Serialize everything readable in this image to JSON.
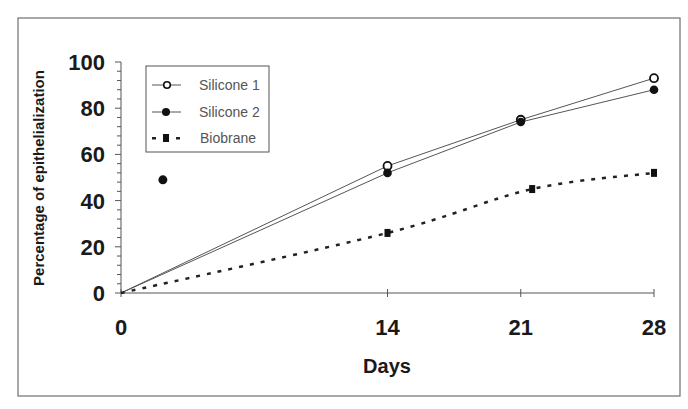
{
  "chart_data": {
    "type": "line",
    "title": "",
    "xlabel": "Days",
    "ylabel": "Percentage of epithelialization",
    "xlim": [
      0,
      28
    ],
    "ylim": [
      0,
      100
    ],
    "x_ticks": [
      0,
      14,
      21,
      28
    ],
    "x_tick_labels": [
      "0",
      "14",
      "21",
      "28"
    ],
    "y_ticks": [
      0,
      20,
      40,
      60,
      80,
      100
    ],
    "y_tick_labels": [
      "0",
      "20",
      "40",
      "60",
      "80",
      "100"
    ],
    "y_minor_step": 4,
    "grid": false,
    "legend_position": "upper-left-inside",
    "series": [
      {
        "name": "Silicone 1",
        "marker": "open-circle",
        "line": "solid",
        "points": [
          [
            0,
            0
          ],
          [
            14,
            55
          ],
          [
            21,
            75
          ],
          [
            28,
            93
          ]
        ]
      },
      {
        "name": "Silicone 2",
        "marker": "filled-circle",
        "line": "solid",
        "points": [
          [
            0,
            0
          ],
          [
            14,
            52
          ],
          [
            21,
            74
          ],
          [
            28,
            88
          ]
        ]
      },
      {
        "name": "Biobrane",
        "marker": "filled-square",
        "line": "dotted",
        "points": [
          [
            0,
            0
          ],
          [
            14,
            26
          ],
          [
            21.6,
            45
          ],
          [
            28,
            52
          ]
        ]
      }
    ],
    "annotations": [
      {
        "type": "isolated-point",
        "marker": "filled-circle",
        "x": 2.2,
        "y": 49
      }
    ]
  },
  "legend": {
    "items": [
      {
        "label": "Silicone 1"
      },
      {
        "label": "Silicone 2"
      },
      {
        "label": "Biobrane"
      }
    ]
  },
  "colors": {
    "axis": "#555555",
    "line": "#555555",
    "marker": "#111111",
    "frame": "#6e6e6e"
  }
}
